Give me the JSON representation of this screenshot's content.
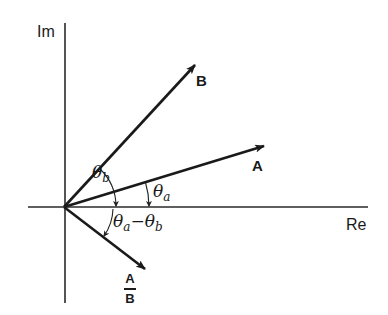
{
  "diagram": {
    "type": "complex-plane-phasor-division",
    "axes": {
      "real_label": "Re",
      "imag_label": "Im"
    },
    "vectors": [
      {
        "id": "A",
        "label": "A"
      },
      {
        "id": "B",
        "label": "B"
      },
      {
        "id": "A_over_B",
        "label_numerator": "A",
        "label_denominator": "B"
      }
    ],
    "angles": {
      "theta_b": {
        "symbol": "θ",
        "subscript": "b"
      },
      "theta_a": {
        "symbol": "θ",
        "subscript": "a"
      },
      "theta_diff": {
        "symbol1": "θ",
        "subscript1": "a",
        "operator": "−",
        "symbol2": "θ",
        "subscript2": "b"
      }
    },
    "colors": {
      "ink": "#1a1a1a",
      "background": "#ffffff"
    }
  }
}
